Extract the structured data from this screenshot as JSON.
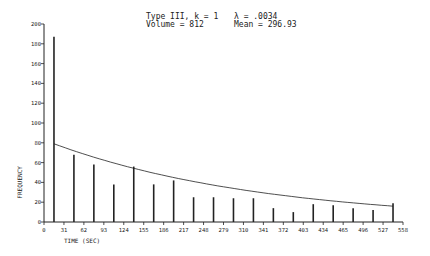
{
  "annotations": {
    "line1_left": "Type III, k = 1",
    "line2_left": "Volume = 812",
    "line1_right": "λ = .0034",
    "line2_right": "Mean = 296.93"
  },
  "colors": {
    "ink": "#222222",
    "background": "#ffffff"
  },
  "chart_data": {
    "type": "bar",
    "xlabel": "TIME (SEC)",
    "ylabel": "FREQUENCY",
    "xlim": [
      0,
      558
    ],
    "ylim": [
      0,
      200
    ],
    "xticks": [
      0,
      31,
      62,
      93,
      124,
      155,
      186,
      217,
      248,
      279,
      310,
      341,
      372,
      403,
      434,
      465,
      496,
      527,
      558
    ],
    "yticks": [
      0,
      20,
      40,
      60,
      80,
      100,
      120,
      140,
      160,
      180,
      200
    ],
    "grid": false,
    "x": [
      15.5,
      46.5,
      77.5,
      108.5,
      139.5,
      170.5,
      201.5,
      232.5,
      263.5,
      294.5,
      325.5,
      356.5,
      387.5,
      418.5,
      449.5,
      480.5,
      511.5,
      542.5
    ],
    "values": [
      187,
      68,
      58,
      38,
      56,
      38,
      42,
      25,
      25,
      24,
      24,
      14,
      10,
      18,
      17,
      14,
      12,
      19
    ],
    "fit_curve": {
      "type": "exponential",
      "lambda": 0.0034,
      "x_start": 15.5,
      "y_start": 79,
      "x_end": 542.5,
      "y_end": 16
    }
  }
}
